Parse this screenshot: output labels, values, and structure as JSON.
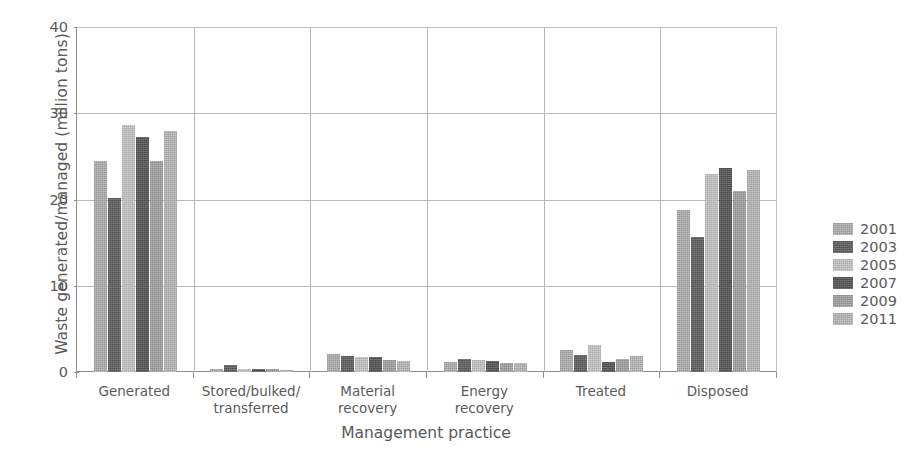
{
  "chart_data": {
    "type": "bar",
    "title": "",
    "xlabel": "Management practice",
    "ylabel": "Waste generated/managed (million tons)",
    "ylim": [
      0,
      40
    ],
    "yticks": [
      0,
      10,
      20,
      30,
      40
    ],
    "grid": true,
    "legend_position": "right",
    "categories": [
      "Generated",
      "Stored/bulked/\ntransferred",
      "Material\nrecovery",
      "Energy\nrecovery",
      "Treated",
      "Disposed"
    ],
    "series": [
      {
        "name": "2001",
        "color": "#a9a9a9",
        "values": [
          24.5,
          0.4,
          2.1,
          1.2,
          2.6,
          18.8
        ]
      },
      {
        "name": "2003",
        "color": "#5e5e5e",
        "values": [
          20.2,
          0.8,
          1.9,
          1.5,
          2.0,
          15.6
        ]
      },
      {
        "name": "2005",
        "color": "#bdbdbd",
        "values": [
          28.6,
          0.4,
          1.7,
          1.4,
          3.1,
          23.0
        ]
      },
      {
        "name": "2007",
        "color": "#555555",
        "values": [
          27.3,
          0.3,
          1.7,
          1.3,
          1.2,
          23.7
        ]
      },
      {
        "name": "2009",
        "color": "#9d9d9d",
        "values": [
          24.5,
          0.4,
          1.4,
          1.0,
          1.5,
          21.0
        ]
      },
      {
        "name": "2011",
        "color": "#b2b2b2",
        "values": [
          27.9,
          0.2,
          1.3,
          1.1,
          1.8,
          23.4
        ]
      }
    ]
  },
  "axes": {
    "y_title": "Waste generated/managed (million tons)",
    "x_title": "Management practice",
    "y_tick_labels": [
      "40",
      "30",
      "20",
      "10",
      "0"
    ],
    "x_tick_labels": [
      [
        "Generated"
      ],
      [
        "Stored/bulked/",
        "transferred"
      ],
      [
        "Material",
        "recovery"
      ],
      [
        "Energy",
        "recovery"
      ],
      [
        "Treated"
      ],
      [
        "Disposed"
      ]
    ]
  },
  "legend": {
    "items": [
      {
        "label": "2001",
        "color": "#a9a9a9"
      },
      {
        "label": "2003",
        "color": "#5e5e5e"
      },
      {
        "label": "2005",
        "color": "#bdbdbd"
      },
      {
        "label": "2007",
        "color": "#555555"
      },
      {
        "label": "2009",
        "color": "#9d9d9d"
      },
      {
        "label": "2011",
        "color": "#b2b2b2"
      }
    ]
  }
}
